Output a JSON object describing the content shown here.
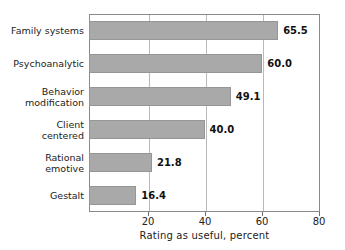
{
  "chart_data": {
    "type": "bar",
    "orientation": "horizontal",
    "title": "",
    "xlabel": "Rating as useful, percent",
    "ylabel": "",
    "xlim": [
      0,
      80
    ],
    "xticks": [
      20,
      40,
      60,
      80
    ],
    "xticklabels": [
      "20",
      "40",
      "60",
      "80"
    ],
    "grid": true,
    "grid_axis": "x",
    "legend": false,
    "categories": [
      "Family systems",
      "Psychoanalytic",
      "Behavior modification",
      "Client centered",
      "Rational emotive",
      "Gestalt"
    ],
    "category_lines": [
      [
        "Family systems"
      ],
      [
        "Psychoanalytic"
      ],
      [
        "Behavior",
        "modification"
      ],
      [
        "Client",
        "centered"
      ],
      [
        "Rational",
        "emotive"
      ],
      [
        "Gestalt"
      ]
    ],
    "values": [
      65.5,
      60.0,
      49.1,
      40.0,
      21.8,
      16.4
    ],
    "value_labels": [
      "65.5",
      "60.0",
      "49.1",
      "40.0",
      "21.8",
      "16.4"
    ],
    "bar_color": "#a9a9a9",
    "bar_edge_color": "#969696",
    "axis_color": "#8a8a8a",
    "grid_color": "#b9b9b9",
    "text_color": "#222222",
    "background": "#ffffff"
  }
}
